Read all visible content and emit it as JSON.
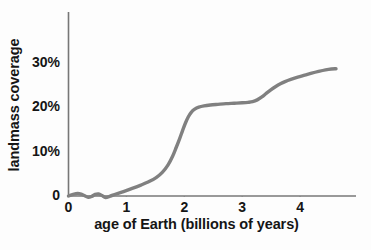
{
  "chart_data": {
    "type": "line",
    "title": "",
    "xlabel": "age of Earth (billions of years)",
    "ylabel": "landmass coverage",
    "xlim": [
      0,
      4.95
    ],
    "ylim": [
      -1.2,
      34
    ],
    "grid": false,
    "legend": null,
    "xticks": [
      "0",
      "1",
      "2",
      "3",
      "4"
    ],
    "xtick_values": [
      0,
      1,
      2,
      3,
      4
    ],
    "yticks": [
      "0",
      "10%",
      "20%",
      "30%"
    ],
    "ytick_values": [
      0,
      10,
      20,
      30
    ],
    "line_color": "#808080",
    "line_width": 3.4,
    "series": [
      {
        "name": "landmass coverage",
        "x": [
          0.0,
          0.08,
          0.16,
          0.22,
          0.28,
          0.34,
          0.4,
          0.46,
          0.52,
          0.58,
          0.64,
          0.72,
          0.82,
          0.95,
          1.1,
          1.25,
          1.4,
          1.52,
          1.62,
          1.72,
          1.8,
          1.86,
          1.92,
          1.97,
          2.02,
          2.07,
          2.12,
          2.18,
          2.25,
          2.34,
          2.45,
          2.58,
          2.72,
          2.86,
          3.0,
          3.1,
          3.18,
          3.26,
          3.34,
          3.42,
          3.5,
          3.58,
          3.66,
          3.74,
          3.84,
          3.96,
          4.08,
          4.2,
          4.32,
          4.44,
          4.54,
          4.62
        ],
        "y": [
          0.0,
          0.35,
          0.55,
          0.4,
          0.05,
          -0.3,
          -0.1,
          0.35,
          0.45,
          0.1,
          -0.35,
          -0.05,
          0.45,
          1.0,
          1.7,
          2.45,
          3.3,
          4.2,
          5.3,
          7.0,
          9.0,
          10.9,
          12.9,
          14.7,
          16.4,
          17.8,
          18.8,
          19.5,
          19.95,
          20.25,
          20.45,
          20.6,
          20.75,
          20.85,
          20.95,
          21.05,
          21.2,
          21.6,
          22.25,
          23.1,
          23.9,
          24.6,
          25.2,
          25.7,
          26.2,
          26.7,
          27.15,
          27.6,
          28.0,
          28.35,
          28.55,
          28.6
        ]
      }
    ]
  }
}
